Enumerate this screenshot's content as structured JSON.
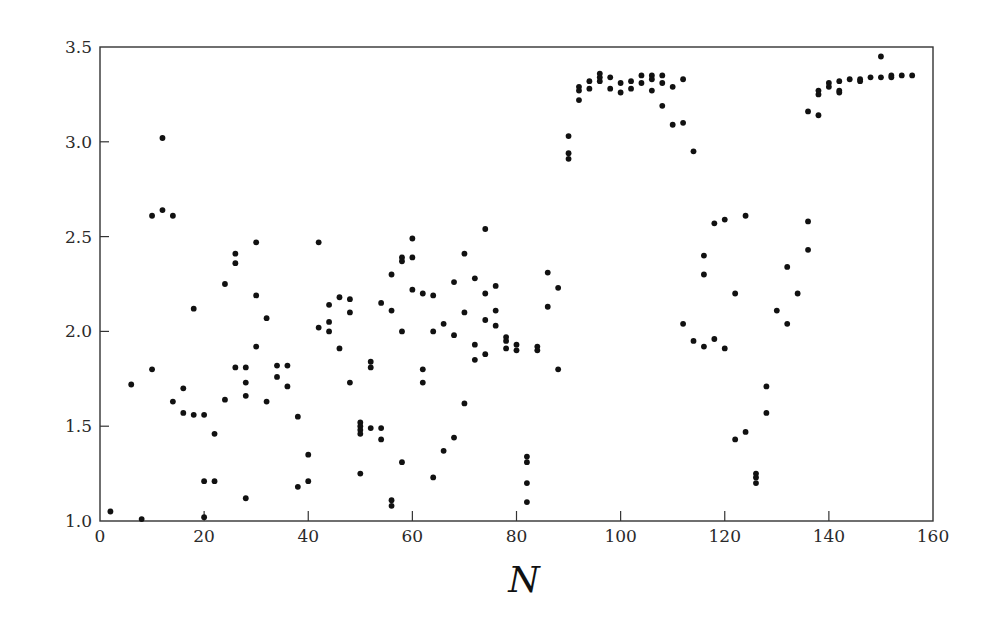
{
  "chart_data": {
    "type": "scatter",
    "title": "",
    "xlabel": "N",
    "ylabel": "",
    "xlim": [
      0,
      160
    ],
    "ylim": [
      1.0,
      3.5
    ],
    "x_ticks": [
      0,
      20,
      40,
      60,
      80,
      100,
      120,
      140,
      160
    ],
    "y_ticks": [
      1.0,
      1.5,
      2.0,
      2.5,
      3.0,
      3.5
    ],
    "x_tick_labels": [
      "0",
      "20",
      "40",
      "60",
      "80",
      "100",
      "120",
      "140",
      "160"
    ],
    "y_tick_labels": [
      "1.0",
      "1.5",
      "2.0",
      "2.5",
      "3.0",
      "3.5"
    ],
    "grid": false,
    "legend": null,
    "marker_color": "#111111",
    "series": [
      {
        "name": "data",
        "points": [
          [
            2,
            1.05
          ],
          [
            6,
            1.72
          ],
          [
            8,
            1.01
          ],
          [
            10,
            2.61
          ],
          [
            10,
            1.8
          ],
          [
            12,
            3.02
          ],
          [
            12,
            2.64
          ],
          [
            14,
            2.61
          ],
          [
            14,
            1.63
          ],
          [
            16,
            1.7
          ],
          [
            16,
            1.57
          ],
          [
            18,
            2.12
          ],
          [
            18,
            1.56
          ],
          [
            20,
            1.56
          ],
          [
            20,
            1.21
          ],
          [
            20,
            1.02
          ],
          [
            22,
            1.46
          ],
          [
            22,
            1.21
          ],
          [
            24,
            2.25
          ],
          [
            24,
            1.64
          ],
          [
            26,
            2.41
          ],
          [
            26,
            2.36
          ],
          [
            26,
            1.81
          ],
          [
            28,
            1.81
          ],
          [
            28,
            1.73
          ],
          [
            28,
            1.66
          ],
          [
            28,
            1.12
          ],
          [
            30,
            2.47
          ],
          [
            30,
            2.19
          ],
          [
            30,
            1.92
          ],
          [
            32,
            2.07
          ],
          [
            32,
            1.63
          ],
          [
            34,
            1.82
          ],
          [
            34,
            1.76
          ],
          [
            36,
            1.82
          ],
          [
            36,
            1.71
          ],
          [
            38,
            1.55
          ],
          [
            38,
            1.18
          ],
          [
            40,
            1.35
          ],
          [
            40,
            1.21
          ],
          [
            42,
            2.47
          ],
          [
            42,
            2.02
          ],
          [
            44,
            2.14
          ],
          [
            44,
            2.05
          ],
          [
            44,
            2.0
          ],
          [
            46,
            2.18
          ],
          [
            46,
            1.91
          ],
          [
            48,
            2.17
          ],
          [
            48,
            2.1
          ],
          [
            48,
            1.73
          ],
          [
            50,
            1.52
          ],
          [
            50,
            1.5
          ],
          [
            50,
            1.48
          ],
          [
            50,
            1.46
          ],
          [
            50,
            1.25
          ],
          [
            52,
            1.84
          ],
          [
            52,
            1.81
          ],
          [
            52,
            1.49
          ],
          [
            54,
            2.15
          ],
          [
            54,
            1.49
          ],
          [
            54,
            1.43
          ],
          [
            56,
            2.3
          ],
          [
            56,
            2.11
          ],
          [
            56,
            1.11
          ],
          [
            56,
            1.08
          ],
          [
            58,
            2.39
          ],
          [
            58,
            2.37
          ],
          [
            58,
            2.0
          ],
          [
            58,
            1.31
          ],
          [
            60,
            2.49
          ],
          [
            60,
            2.39
          ],
          [
            60,
            2.22
          ],
          [
            62,
            2.2
          ],
          [
            62,
            1.8
          ],
          [
            62,
            1.73
          ],
          [
            64,
            2.19
          ],
          [
            64,
            2.0
          ],
          [
            64,
            1.23
          ],
          [
            66,
            2.04
          ],
          [
            66,
            1.37
          ],
          [
            68,
            2.26
          ],
          [
            68,
            1.98
          ],
          [
            68,
            1.44
          ],
          [
            70,
            2.41
          ],
          [
            70,
            2.1
          ],
          [
            70,
            1.62
          ],
          [
            72,
            2.28
          ],
          [
            72,
            1.93
          ],
          [
            72,
            1.85
          ],
          [
            74,
            2.54
          ],
          [
            74,
            2.2
          ],
          [
            74,
            2.06
          ],
          [
            74,
            1.88
          ],
          [
            76,
            2.24
          ],
          [
            76,
            2.11
          ],
          [
            76,
            2.03
          ],
          [
            78,
            1.97
          ],
          [
            78,
            1.95
          ],
          [
            78,
            1.91
          ],
          [
            80,
            1.93
          ],
          [
            80,
            1.9
          ],
          [
            82,
            1.34
          ],
          [
            82,
            1.31
          ],
          [
            82,
            1.2
          ],
          [
            82,
            1.1
          ],
          [
            84,
            1.92
          ],
          [
            84,
            1.9
          ],
          [
            86,
            2.31
          ],
          [
            86,
            2.13
          ],
          [
            88,
            2.23
          ],
          [
            88,
            1.8
          ],
          [
            90,
            3.03
          ],
          [
            90,
            2.94
          ],
          [
            90,
            2.91
          ],
          [
            92,
            3.29
          ],
          [
            92,
            3.27
          ],
          [
            92,
            3.22
          ],
          [
            94,
            3.32
          ],
          [
            94,
            3.28
          ],
          [
            96,
            3.36
          ],
          [
            96,
            3.34
          ],
          [
            96,
            3.32
          ],
          [
            98,
            3.34
          ],
          [
            98,
            3.28
          ],
          [
            100,
            3.31
          ],
          [
            100,
            3.26
          ],
          [
            102,
            3.32
          ],
          [
            102,
            3.28
          ],
          [
            104,
            3.35
          ],
          [
            104,
            3.31
          ],
          [
            106,
            3.35
          ],
          [
            106,
            3.33
          ],
          [
            106,
            3.27
          ],
          [
            108,
            3.35
          ],
          [
            108,
            3.31
          ],
          [
            108,
            3.19
          ],
          [
            110,
            3.29
          ],
          [
            110,
            3.09
          ],
          [
            112,
            3.33
          ],
          [
            112,
            3.1
          ],
          [
            114,
            2.95
          ],
          [
            112,
            2.04
          ],
          [
            114,
            1.95
          ],
          [
            116,
            2.4
          ],
          [
            116,
            2.3
          ],
          [
            116,
            1.92
          ],
          [
            118,
            2.57
          ],
          [
            118,
            1.96
          ],
          [
            120,
            2.59
          ],
          [
            120,
            1.91
          ],
          [
            122,
            2.2
          ],
          [
            122,
            1.43
          ],
          [
            124,
            2.61
          ],
          [
            124,
            1.47
          ],
          [
            126,
            1.25
          ],
          [
            126,
            1.23
          ],
          [
            126,
            1.2
          ],
          [
            128,
            1.71
          ],
          [
            128,
            1.57
          ],
          [
            130,
            2.11
          ],
          [
            132,
            2.34
          ],
          [
            132,
            2.04
          ],
          [
            134,
            2.2
          ],
          [
            136,
            2.58
          ],
          [
            136,
            2.43
          ],
          [
            136,
            3.16
          ],
          [
            138,
            3.14
          ],
          [
            138,
            3.27
          ],
          [
            138,
            3.25
          ],
          [
            140,
            3.31
          ],
          [
            140,
            3.29
          ],
          [
            142,
            3.32
          ],
          [
            142,
            3.27
          ],
          [
            142,
            3.26
          ],
          [
            144,
            3.33
          ],
          [
            146,
            3.33
          ],
          [
            146,
            3.32
          ],
          [
            148,
            3.34
          ],
          [
            150,
            3.45
          ],
          [
            150,
            3.34
          ],
          [
            152,
            3.35
          ],
          [
            152,
            3.34
          ],
          [
            154,
            3.35
          ],
          [
            156,
            3.35
          ]
        ]
      }
    ]
  }
}
